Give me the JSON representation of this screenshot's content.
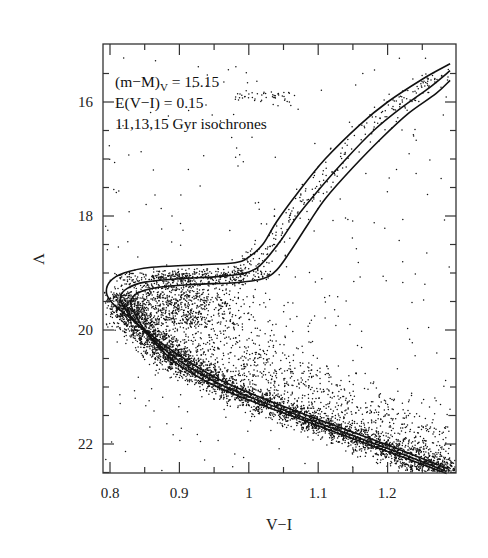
{
  "chart_data": {
    "type": "scatter",
    "title": "",
    "xlabel": "V−I",
    "ylabel": "V",
    "xlim": [
      0.75,
      1.29
    ],
    "ylim": [
      22.5,
      15.0
    ],
    "y_inverted": true,
    "grid": false,
    "legend": null,
    "x_ticks": [
      0.8,
      0.9,
      1.0,
      1.1,
      1.2
    ],
    "x_tick_labels": [
      "0.8",
      "0.9",
      "1",
      "1.1",
      "1.2"
    ],
    "x_minor_ticks": [
      0.85,
      0.95,
      1.05,
      1.15,
      1.25
    ],
    "y_ticks": [
      16,
      18,
      20,
      22
    ],
    "y_tick_labels": [
      "16",
      "18",
      "20",
      "22"
    ],
    "y_minor_ticks": [
      15.5,
      16.5,
      17,
      17.5,
      18.5,
      19,
      19.5,
      20.5,
      21,
      21.5,
      22.5
    ],
    "annotations": [
      {
        "text": "(m−M)",
        "subscript": "V",
        "suffix": " = 15.15"
      },
      {
        "text": "E(V−I) = 0.15"
      },
      {
        "text": "11,13,15 Gyr isochrones"
      }
    ],
    "series": [
      {
        "name": "11 Gyr isochrone",
        "type": "line",
        "points": [
          [
            1.285,
            22.42
          ],
          [
            1.2,
            22.02
          ],
          [
            1.1,
            21.57
          ],
          [
            1.0,
            21.1
          ],
          [
            0.95,
            20.82
          ],
          [
            0.9,
            20.45
          ],
          [
            0.86,
            20.1
          ],
          [
            0.83,
            19.8
          ],
          [
            0.805,
            19.55
          ],
          [
            0.795,
            19.35
          ],
          [
            0.8,
            19.15
          ],
          [
            0.82,
            19.0
          ],
          [
            0.86,
            18.9
          ],
          [
            0.92,
            18.86
          ],
          [
            0.98,
            18.82
          ],
          [
            1.0,
            18.72
          ],
          [
            1.02,
            18.5
          ],
          [
            1.04,
            18.1
          ],
          [
            1.07,
            17.6
          ],
          [
            1.11,
            17.0
          ],
          [
            1.16,
            16.4
          ],
          [
            1.2,
            16.0
          ],
          [
            1.25,
            15.6
          ],
          [
            1.29,
            15.33
          ]
        ]
      },
      {
        "name": "13 Gyr isochrone",
        "type": "line",
        "points": [
          [
            1.285,
            22.48
          ],
          [
            1.2,
            22.08
          ],
          [
            1.1,
            21.63
          ],
          [
            1.0,
            21.17
          ],
          [
            0.95,
            20.9
          ],
          [
            0.9,
            20.54
          ],
          [
            0.865,
            20.2
          ],
          [
            0.84,
            19.9
          ],
          [
            0.82,
            19.6
          ],
          [
            0.815,
            19.42
          ],
          [
            0.825,
            19.27
          ],
          [
            0.85,
            19.16
          ],
          [
            0.9,
            19.1
          ],
          [
            0.96,
            19.06
          ],
          [
            1.0,
            18.98
          ],
          [
            1.02,
            18.82
          ],
          [
            1.045,
            18.45
          ],
          [
            1.07,
            18.0
          ],
          [
            1.1,
            17.55
          ],
          [
            1.14,
            17.0
          ],
          [
            1.18,
            16.5
          ],
          [
            1.22,
            16.1
          ],
          [
            1.26,
            15.75
          ],
          [
            1.29,
            15.45
          ]
        ]
      },
      {
        "name": "15 Gyr isochrone",
        "type": "line",
        "points": [
          [
            1.285,
            22.52
          ],
          [
            1.2,
            22.13
          ],
          [
            1.1,
            21.68
          ],
          [
            1.0,
            21.23
          ],
          [
            0.95,
            20.97
          ],
          [
            0.9,
            20.62
          ],
          [
            0.87,
            20.3
          ],
          [
            0.85,
            20.0
          ],
          [
            0.835,
            19.7
          ],
          [
            0.83,
            19.5
          ],
          [
            0.84,
            19.35
          ],
          [
            0.87,
            19.25
          ],
          [
            0.92,
            19.2
          ],
          [
            0.98,
            19.17
          ],
          [
            1.02,
            19.1
          ],
          [
            1.04,
            18.95
          ],
          [
            1.06,
            18.62
          ],
          [
            1.085,
            18.15
          ],
          [
            1.11,
            17.7
          ],
          [
            1.15,
            17.15
          ],
          [
            1.19,
            16.65
          ],
          [
            1.23,
            16.2
          ],
          [
            1.27,
            15.85
          ],
          [
            1.29,
            15.62
          ]
        ]
      },
      {
        "name": "observed stars",
        "type": "scatter",
        "description": "Several thousand photometric points: dense main sequence from (0.82,19.6) to (1.29,22.5), turnoff near V≈19.5–20 at V−I≈0.82, sparse subgiant/red-giant branch following isochrones up to V≈15.5, horizontal-branch clump near V≈15.9–16.0 at V−I≈0.98–1.07, and scattered field/binary stars to the red of the main sequence.",
        "regions": [
          {
            "name": "main-sequence",
            "vi_range": [
              0.8,
              1.29
            ],
            "v_range": [
              19.3,
              22.6
            ]
          },
          {
            "name": "horizontal-branch",
            "vi_range": [
              0.98,
              1.07
            ],
            "v_range": [
              15.7,
              16.05
            ]
          },
          {
            "name": "red-giant-branch",
            "vi_range": [
              1.0,
              1.29
            ],
            "v_range": [
              15.4,
              19.0
            ]
          }
        ]
      }
    ]
  },
  "labels": {
    "xlabel": "V−I",
    "ylabel": "V",
    "annot_line1_main": "(m−M)",
    "annot_line1_sub": "V",
    "annot_line1_suffix": " = 15.15",
    "annot_line2": "E(V−I) = 0.15",
    "annot_line3": "11,13,15 Gyr isochrones",
    "x_ticks": [
      "0.8",
      "0.9",
      "1",
      "1.1",
      "1.2"
    ],
    "y_ticks": [
      "16",
      "18",
      "20",
      "22"
    ]
  },
  "style": {
    "ink": "#111111",
    "frame": "#333333",
    "background": "#ffffff"
  }
}
